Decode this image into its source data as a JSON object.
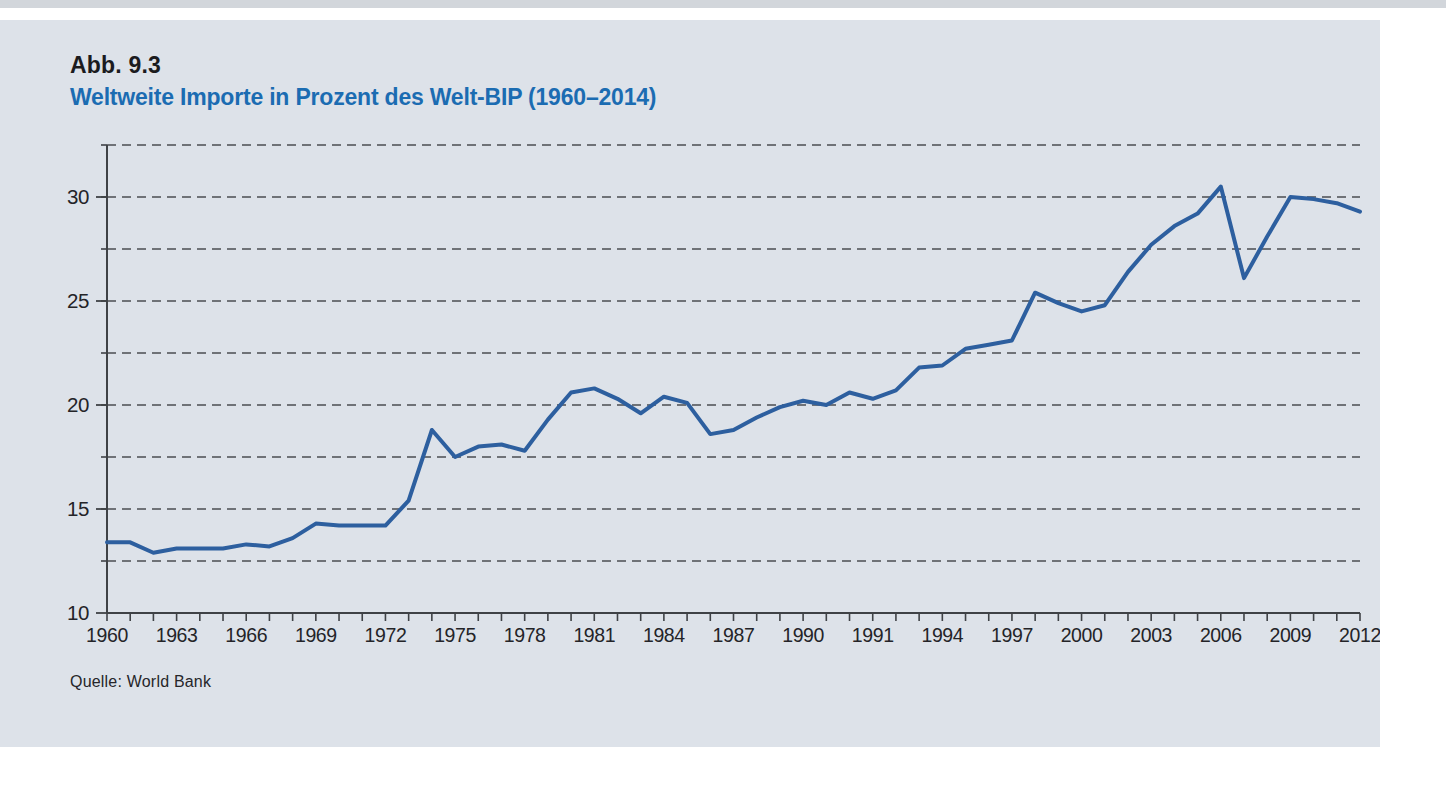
{
  "figure": {
    "label": "Abb. 9.3",
    "title": "Weltweite Importe in Prozent des Welt-BIP (1960–2014)",
    "source": "Quelle: World Bank"
  },
  "colors": {
    "page_background": "#ffffff",
    "page_top_edge": "#d2d6db",
    "panel_background": "#dde2e9",
    "title_blue": "#1b6cb2",
    "text_dark": "#242428",
    "line_blue": "#2d5f9f",
    "gridline_gray": "#4b4e52",
    "axis_gray": "#3f4246"
  },
  "chart_data": {
    "type": "line",
    "title": "Weltweite Importe in Prozent des Welt-BIP (1960–2014)",
    "xlabel": "",
    "ylabel": "",
    "xlim": [
      1960,
      2014
    ],
    "ylim": [
      10,
      32.7
    ],
    "grid": "dashed-horizontal",
    "legend": "none",
    "x": [
      1960,
      1961,
      1962,
      1963,
      1964,
      1965,
      1966,
      1967,
      1968,
      1969,
      1970,
      1971,
      1972,
      1973,
      1974,
      1975,
      1976,
      1977,
      1978,
      1979,
      1980,
      1981,
      1982,
      1983,
      1984,
      1985,
      1986,
      1987,
      1988,
      1989,
      1990,
      1991,
      1992,
      1993,
      1994,
      1995,
      1996,
      1997,
      1998,
      1999,
      2000,
      2001,
      2002,
      2003,
      2004,
      2005,
      2006,
      2007,
      2008,
      2009,
      2010,
      2011,
      2012,
      2013,
      2014
    ],
    "values": [
      13.4,
      13.4,
      12.9,
      13.1,
      13.1,
      13.1,
      13.3,
      13.2,
      13.6,
      14.3,
      14.2,
      14.2,
      14.2,
      15.4,
      18.8,
      17.5,
      18.0,
      18.1,
      17.8,
      19.3,
      20.6,
      20.8,
      20.3,
      19.6,
      20.4,
      20.1,
      18.6,
      18.8,
      19.4,
      19.9,
      20.2,
      20.0,
      20.6,
      20.3,
      20.7,
      21.8,
      21.9,
      22.7,
      22.9,
      23.1,
      25.4,
      24.9,
      24.5,
      24.8,
      26.4,
      27.7,
      28.6,
      29.2,
      30.5,
      26.1,
      28.1,
      30.0,
      29.9,
      29.7,
      29.3
    ],
    "y_tick_labels": [
      "10",
      "15",
      "20",
      "25",
      "30"
    ],
    "y_tick_values": [
      10,
      15,
      20,
      25,
      30
    ],
    "gridline_values": [
      12.5,
      15,
      17.5,
      20,
      22.5,
      25,
      27.5,
      30,
      32.5
    ],
    "x_tick_every_years": 1,
    "x_label_slot_step_years": 3,
    "x_tick_labels": [
      "1960",
      "1963",
      "1966",
      "1969",
      "1972",
      "1975",
      "1978",
      "1981",
      "1984",
      "1987",
      "1990",
      "1991",
      "1994",
      "1997",
      "2000",
      "2003",
      "2006",
      "2009",
      "2012"
    ]
  }
}
